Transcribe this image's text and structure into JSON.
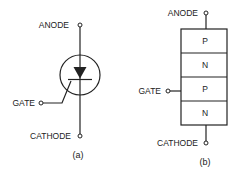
{
  "diagram_a": {
    "caption": "(a)",
    "type": "scr-schematic-symbol",
    "labels": {
      "anode": "ANODE",
      "gate": "GATE",
      "cathode": "CATHODE"
    }
  },
  "diagram_b": {
    "caption": "(b)",
    "type": "pnpn-layer-structure",
    "labels": {
      "anode": "ANODE",
      "gate": "GATE",
      "cathode": "CATHODE"
    },
    "layers": [
      "P",
      "N",
      "P",
      "N"
    ]
  },
  "colors": {
    "line": "#222222",
    "background": "#ffffff"
  }
}
